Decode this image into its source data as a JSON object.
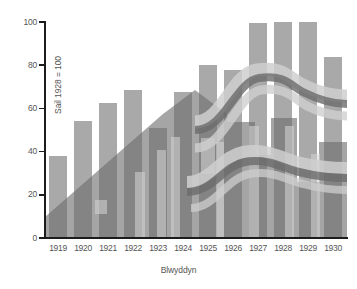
{
  "chart_data": {
    "type": "bar",
    "title": "",
    "xlabel": "Blwyddyn",
    "ylabel": "Sail 1928 = 100",
    "categories": [
      "1919",
      "1920",
      "1921",
      "1922",
      "1923",
      "1924",
      "1925",
      "1926",
      "1927",
      "1928",
      "1929",
      "1930"
    ],
    "values": [
      38,
      54,
      62.5,
      68.5,
      51,
      67.5,
      80,
      78,
      99.5,
      100,
      100,
      84
    ],
    "ylim": [
      0,
      100
    ],
    "yticks": [
      0,
      20,
      40,
      60,
      80,
      100
    ],
    "ytick_labels": [
      "0",
      "20",
      "40",
      "60",
      "80",
      "100"
    ],
    "grid": false,
    "legend": "none",
    "bar_color": "#a9a9a9",
    "axis_color": "#1c1c1c",
    "text_color": "#555555",
    "background": "#ffffff",
    "watermark": {
      "description": "faint grey ghost image of terraced houses and winding ribbon roads overlaying the bars",
      "house_color": "#7d7d7d",
      "road_color": "#8f8f8f",
      "highlight_color": "#c9c9c9"
    }
  }
}
